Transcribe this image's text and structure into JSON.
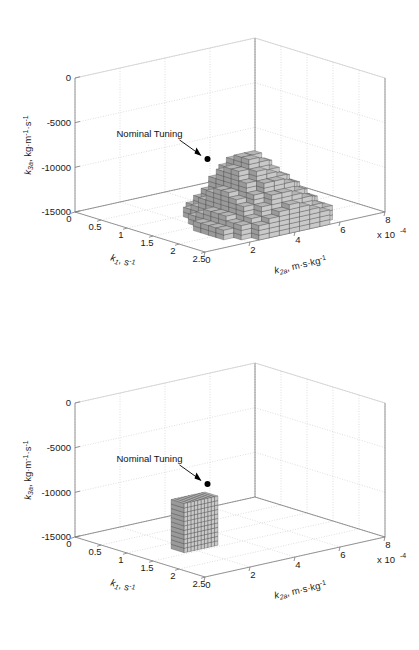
{
  "figure": {
    "background": "#ffffff",
    "panel_count": 2
  },
  "chart_data": [
    {
      "id": "top-panel",
      "type": "scatter",
      "render_style": "3d-voxel-volume",
      "title": "",
      "xlabel": "k_1, s^-1",
      "xlabel_base": "k",
      "xlabel_sub": "1",
      "xlabel_unit": ", s",
      "xlabel_unit_exp": "-1",
      "ylabel": "k_2a, m-s-kg^-1",
      "ylabel_base": "k",
      "ylabel_sub": "2a",
      "ylabel_unit": ", m·s·kg",
      "ylabel_unit_exp": "-1",
      "zlabel": "k_3a, kg-m^-1-s^-1",
      "zlabel_base": "k",
      "zlabel_sub": "3a",
      "zlabel_unit": ", kg·m",
      "zlabel_unit_exp1": "-1",
      "zlabel_unit_mid": "·s",
      "zlabel_unit_exp2": "-1",
      "xticks": [
        0,
        0.5,
        1,
        1.5,
        2,
        2.5
      ],
      "xticklabels": [
        "0",
        "0.5",
        "1",
        "1.5",
        "2",
        "2.5"
      ],
      "yticks": [
        0,
        2,
        4,
        6,
        8
      ],
      "yticklabels": [
        "0",
        "2",
        "4",
        "6",
        "8"
      ],
      "y_exponent_text": "x 10",
      "y_exponent_power": "-4",
      "zticks": [
        0,
        -5000,
        -10000,
        -15000
      ],
      "zticklabels": [
        "0",
        "-5000",
        "-10000",
        "-15000"
      ],
      "xlim": [
        0,
        2.5
      ],
      "ylim": [
        0,
        8
      ],
      "zlim": [
        -15000,
        0
      ],
      "grid": true,
      "grid_style": "dotted",
      "grid_color": "#c8c8c8",
      "axis_color": "#7a7a7a",
      "annotations": [
        {
          "name": "nominal-tuning",
          "text": "Nominal Tuning",
          "marker": "filled-circle",
          "marker_color": "#000000",
          "marker_point": {
            "k1": 1.25,
            "k2a": 3.0,
            "k3a": -8500
          }
        }
      ],
      "volume": {
        "fill_top": "#b5b5b5",
        "fill_left": "#9a9a9a",
        "fill_right": "#c9c9c9",
        "edge": "#4a4a4a",
        "description": "large mound-shaped voxel cloud spanning k1 0.9-2.5, k2a 1.5-6.0, k3a -15000 to -6500",
        "k1_range": [
          0.9,
          2.5
        ],
        "k2a_range": [
          1.5,
          6.0
        ],
        "k3a_range": [
          -15000,
          -6500
        ],
        "columns": [
          {
            "i": 0,
            "j": 3,
            "h": 2
          },
          {
            "i": 0,
            "j": 4,
            "h": 3
          },
          {
            "i": 0,
            "j": 5,
            "h": 3
          },
          {
            "i": 0,
            "j": 6,
            "h": 2
          },
          {
            "i": 0,
            "j": 7,
            "h": 2
          },
          {
            "i": 1,
            "j": 2,
            "h": 2
          },
          {
            "i": 1,
            "j": 3,
            "h": 4
          },
          {
            "i": 1,
            "j": 4,
            "h": 5
          },
          {
            "i": 1,
            "j": 5,
            "h": 5
          },
          {
            "i": 1,
            "j": 6,
            "h": 4
          },
          {
            "i": 1,
            "j": 7,
            "h": 3
          },
          {
            "i": 1,
            "j": 8,
            "h": 2
          },
          {
            "i": 2,
            "j": 2,
            "h": 3
          },
          {
            "i": 2,
            "j": 3,
            "h": 6
          },
          {
            "i": 2,
            "j": 4,
            "h": 8
          },
          {
            "i": 2,
            "j": 5,
            "h": 8
          },
          {
            "i": 2,
            "j": 6,
            "h": 6
          },
          {
            "i": 2,
            "j": 7,
            "h": 5
          },
          {
            "i": 2,
            "j": 8,
            "h": 3
          },
          {
            "i": 2,
            "j": 9,
            "h": 2
          },
          {
            "i": 3,
            "j": 1,
            "h": 2
          },
          {
            "i": 3,
            "j": 2,
            "h": 5
          },
          {
            "i": 3,
            "j": 3,
            "h": 9
          },
          {
            "i": 3,
            "j": 4,
            "h": 11
          },
          {
            "i": 3,
            "j": 5,
            "h": 11
          },
          {
            "i": 3,
            "j": 6,
            "h": 9
          },
          {
            "i": 3,
            "j": 7,
            "h": 7
          },
          {
            "i": 3,
            "j": 8,
            "h": 5
          },
          {
            "i": 3,
            "j": 9,
            "h": 3
          },
          {
            "i": 4,
            "j": 1,
            "h": 3
          },
          {
            "i": 4,
            "j": 2,
            "h": 7
          },
          {
            "i": 4,
            "j": 3,
            "h": 11
          },
          {
            "i": 4,
            "j": 4,
            "h": 13
          },
          {
            "i": 4,
            "j": 5,
            "h": 13
          },
          {
            "i": 4,
            "j": 6,
            "h": 11
          },
          {
            "i": 4,
            "j": 7,
            "h": 9
          },
          {
            "i": 4,
            "j": 8,
            "h": 6
          },
          {
            "i": 4,
            "j": 9,
            "h": 4
          },
          {
            "i": 5,
            "j": 0,
            "h": 2
          },
          {
            "i": 5,
            "j": 1,
            "h": 4
          },
          {
            "i": 5,
            "j": 2,
            "h": 8
          },
          {
            "i": 5,
            "j": 3,
            "h": 12
          },
          {
            "i": 5,
            "j": 4,
            "h": 14
          },
          {
            "i": 5,
            "j": 5,
            "h": 14
          },
          {
            "i": 5,
            "j": 6,
            "h": 12
          },
          {
            "i": 5,
            "j": 7,
            "h": 9
          },
          {
            "i": 5,
            "j": 8,
            "h": 7
          },
          {
            "i": 5,
            "j": 9,
            "h": 4
          },
          {
            "i": 6,
            "j": 0,
            "h": 2
          },
          {
            "i": 6,
            "j": 1,
            "h": 4
          },
          {
            "i": 6,
            "j": 2,
            "h": 8
          },
          {
            "i": 6,
            "j": 3,
            "h": 12
          },
          {
            "i": 6,
            "j": 4,
            "h": 14
          },
          {
            "i": 6,
            "j": 5,
            "h": 13
          },
          {
            "i": 6,
            "j": 6,
            "h": 11
          },
          {
            "i": 6,
            "j": 7,
            "h": 9
          },
          {
            "i": 6,
            "j": 8,
            "h": 7
          },
          {
            "i": 6,
            "j": 9,
            "h": 4
          },
          {
            "i": 7,
            "j": 0,
            "h": 2
          },
          {
            "i": 7,
            "j": 1,
            "h": 4
          },
          {
            "i": 7,
            "j": 2,
            "h": 7
          },
          {
            "i": 7,
            "j": 3,
            "h": 10
          },
          {
            "i": 7,
            "j": 4,
            "h": 12
          },
          {
            "i": 7,
            "j": 5,
            "h": 11
          },
          {
            "i": 7,
            "j": 6,
            "h": 10
          },
          {
            "i": 7,
            "j": 7,
            "h": 8
          },
          {
            "i": 7,
            "j": 8,
            "h": 6
          },
          {
            "i": 7,
            "j": 9,
            "h": 4
          },
          {
            "i": 8,
            "j": 0,
            "h": 2
          },
          {
            "i": 8,
            "j": 1,
            "h": 3
          },
          {
            "i": 8,
            "j": 2,
            "h": 6
          },
          {
            "i": 8,
            "j": 3,
            "h": 8
          },
          {
            "i": 8,
            "j": 4,
            "h": 10
          },
          {
            "i": 8,
            "j": 5,
            "h": 10
          },
          {
            "i": 8,
            "j": 6,
            "h": 9
          },
          {
            "i": 8,
            "j": 7,
            "h": 7
          },
          {
            "i": 8,
            "j": 8,
            "h": 5
          },
          {
            "i": 8,
            "j": 9,
            "h": 3
          },
          {
            "i": 9,
            "j": 1,
            "h": 3
          },
          {
            "i": 9,
            "j": 2,
            "h": 4
          },
          {
            "i": 9,
            "j": 3,
            "h": 6
          },
          {
            "i": 9,
            "j": 4,
            "h": 8
          },
          {
            "i": 9,
            "j": 5,
            "h": 8
          },
          {
            "i": 9,
            "j": 6,
            "h": 7
          },
          {
            "i": 9,
            "j": 7,
            "h": 6
          },
          {
            "i": 9,
            "j": 8,
            "h": 4
          },
          {
            "i": 9,
            "j": 9,
            "h": 3
          },
          {
            "i": 10,
            "j": 2,
            "h": 3
          },
          {
            "i": 10,
            "j": 3,
            "h": 4
          },
          {
            "i": 10,
            "j": 4,
            "h": 5
          },
          {
            "i": 10,
            "j": 5,
            "h": 6
          },
          {
            "i": 10,
            "j": 6,
            "h": 5
          },
          {
            "i": 10,
            "j": 7,
            "h": 4
          },
          {
            "i": 10,
            "j": 8,
            "h": 3
          }
        ]
      }
    },
    {
      "id": "bottom-panel",
      "type": "scatter",
      "render_style": "3d-voxel-slab",
      "title": "",
      "xlabel_base": "k",
      "xlabel_sub": "1",
      "xlabel_unit": ", s",
      "xlabel_unit_exp": "-1",
      "ylabel_base": "k",
      "ylabel_sub": "2a",
      "ylabel_unit": ", m·s·kg",
      "ylabel_unit_exp": "-1",
      "zlabel_base": "k",
      "zlabel_sub": "3a",
      "zlabel_unit": ", kg·m",
      "zlabel_unit_exp1": "-1",
      "zlabel_unit_mid": "·s",
      "zlabel_unit_exp2": "-1",
      "xticks": [
        0,
        0.5,
        1,
        1.5,
        2,
        2.5
      ],
      "xticklabels": [
        "0",
        "0.5",
        "1",
        "1.5",
        "2",
        "2.5"
      ],
      "yticks": [
        0,
        2,
        4,
        6,
        8
      ],
      "yticklabels": [
        "0",
        "2",
        "4",
        "6",
        "8"
      ],
      "y_exponent_text": "x 10",
      "y_exponent_power": "-4",
      "zticks": [
        0,
        -5000,
        -10000,
        -15000
      ],
      "zticklabels": [
        "0",
        "-5000",
        "-10000",
        "-15000"
      ],
      "xlim": [
        0,
        2.5
      ],
      "ylim": [
        0,
        8
      ],
      "zlim": [
        -15000,
        0
      ],
      "grid": true,
      "grid_style": "dotted",
      "grid_color": "#c8c8c8",
      "axis_color": "#7a7a7a",
      "annotations": [
        {
          "name": "nominal-tuning",
          "text": "Nominal Tuning",
          "marker": "filled-circle",
          "marker_color": "#000000",
          "marker_point": {
            "k1": 1.25,
            "k2a": 3.0,
            "k3a": -8500
          }
        }
      ],
      "volume": {
        "fill_top": "#b5b5b5",
        "fill_left": "#9a9a9a",
        "fill_right": "#c9c9c9",
        "edge": "#4a4a4a",
        "description": "thin single-cell-deep vertical slab at k1 near 1.3, spanning k2a 1.5-3.0 and k3a -15000 to -9500",
        "k1_range": [
          1.2,
          1.45
        ],
        "k2a_range": [
          1.5,
          3.0
        ],
        "k3a_range": [
          -15000,
          -9500
        ],
        "slab_depth_cells": 1,
        "slab_cols": 10,
        "slab_rows": 11
      }
    }
  ]
}
